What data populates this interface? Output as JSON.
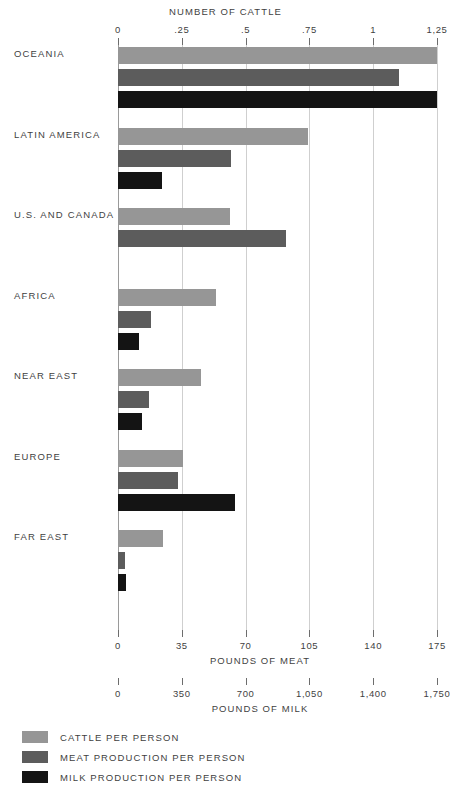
{
  "chart_data": {
    "type": "bar",
    "orientation": "horizontal",
    "title": "",
    "categories": [
      "OCEANIA",
      "LATIN AMERICA",
      "U.S. AND CANADA",
      "AFRICA",
      "NEAR EAST",
      "EUROPE",
      "FAR EAST"
    ],
    "series": [
      {
        "name": "CATTLE PER PERSON",
        "color": "#969696",
        "axis": "NUMBER OF CATTLE",
        "values": [
          1.25,
          0.745,
          0.44,
          0.385,
          0.325,
          0.255,
          0.175
        ]
      },
      {
        "name": "MEAT PRODUCTION PER PERSON",
        "color": "#5c5c5c",
        "axis": "POUNDS OF MEAT",
        "values": [
          154,
          62,
          92,
          18,
          17,
          33,
          4
        ]
      },
      {
        "name": "MILK PRODUCTION PER PERSON",
        "color": "#141414",
        "axis": "POUNDS OF MILK",
        "values": [
          1750,
          240,
          0,
          115,
          130,
          640,
          45
        ]
      }
    ],
    "axes": [
      {
        "id": "cattle",
        "position": "top",
        "label": "NUMBER OF CATTLE",
        "ticks": [
          "0",
          ".25",
          ".5",
          ".75",
          "1",
          "1,25"
        ],
        "range": [
          0,
          1.25
        ]
      },
      {
        "id": "meat",
        "position": "bottom",
        "label": "POUNDS OF MEAT",
        "ticks": [
          "0",
          "35",
          "70",
          "105",
          "140",
          "175"
        ],
        "range": [
          0,
          175
        ]
      },
      {
        "id": "milk",
        "position": "bottom",
        "label": "POUNDS OF MILK",
        "ticks": [
          "0",
          "350",
          "700",
          "1,050",
          "1,400",
          "1,750"
        ],
        "range": [
          0,
          1750
        ]
      }
    ],
    "grid": true,
    "legend_position": "bottom-left",
    "legend": [
      "CATTLE PER PERSON",
      "MEAT PRODUCTION PER PERSON",
      "MILK PRODUCTION PER PERSON"
    ]
  },
  "layout": {
    "plot_left": 118,
    "plot_right": 437,
    "unit_px_per_tick": 63.8
  }
}
